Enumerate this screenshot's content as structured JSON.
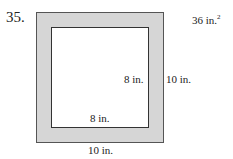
{
  "problem_number": "35.",
  "answer": {
    "value": "36 in.",
    "exponent": "2"
  },
  "outer_square": {
    "width_label": "10 in.",
    "height_label": "10 in.",
    "fill": "#d6d6d6"
  },
  "inner_square": {
    "width_label": "8 in.",
    "height_label": "8 in.",
    "fill": "#ffffff"
  }
}
